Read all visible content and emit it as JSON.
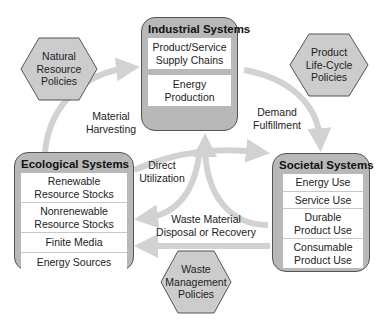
{
  "systems": {
    "industrial": {
      "title": "Industrial Systems",
      "items": [
        {
          "line1": "Product/Service",
          "line2": "Supply Chains"
        },
        {
          "line1": "Energy",
          "line2": "Production"
        }
      ]
    },
    "ecological": {
      "title": "Ecological Systems",
      "items": [
        {
          "line1": "Renewable",
          "line2": "Resource Stocks"
        },
        {
          "line1": "Nonrenewable",
          "line2": "Resource Stocks"
        },
        {
          "line1": "Finite Media",
          "line2": ""
        },
        {
          "line1": "Energy Sources",
          "line2": ""
        }
      ]
    },
    "societal": {
      "title": "Societal Systems",
      "items": [
        {
          "line1": "Energy Use",
          "line2": ""
        },
        {
          "line1": "Service Use",
          "line2": ""
        },
        {
          "line1": "Durable",
          "line2": "Product Use"
        },
        {
          "line1": "Consumable",
          "line2": "Product Use"
        }
      ]
    }
  },
  "policies": {
    "natural_resource": {
      "line1": "Natural",
      "line2": "Resource",
      "line3": "Policies"
    },
    "product_life_cycle": {
      "line1": "Product",
      "line2": "Life-Cycle",
      "line3": "Policies"
    },
    "waste_management": {
      "line1": "Waste",
      "line2": "Management",
      "line3": "Policies"
    }
  },
  "flows": {
    "material_harvesting": {
      "line1": "Material",
      "line2": "Harvesting"
    },
    "demand_fulfillment": {
      "line1": "Demand",
      "line2": "Fulfillment"
    },
    "direct_utilization": {
      "line1": "Direct",
      "line2": "Utilization"
    },
    "waste_disposal": {
      "line1": "Waste Material",
      "line2": "Disposal or Recovery"
    }
  },
  "colors": {
    "box_fill": "#b8b8b8",
    "box_border": "#555555",
    "arrow": "#d0d0d0",
    "hex_fill": "#cccccc"
  }
}
